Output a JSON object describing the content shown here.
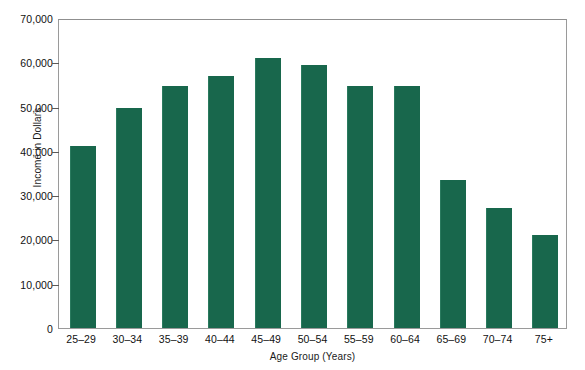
{
  "chart_data": {
    "type": "bar",
    "title": "",
    "xlabel": "Age Group (Years)",
    "ylabel": "Income in Dollars",
    "categories": [
      "25–29",
      "30–34",
      "35–39",
      "40–44",
      "45–49",
      "50–54",
      "55–59",
      "60–64",
      "65–69",
      "70–74",
      "75+"
    ],
    "values": [
      41000,
      49700,
      54600,
      57000,
      61000,
      59300,
      54700,
      54700,
      33500,
      27200,
      20900
    ],
    "ylim": [
      0,
      70000
    ],
    "ytick_values": [
      0,
      10000,
      20000,
      30000,
      40000,
      50000,
      60000,
      70000
    ],
    "ytick_labels": [
      "0",
      "10,000",
      "20,000",
      "30,000",
      "40,000",
      "50,000",
      "60,000",
      "70,000"
    ],
    "grid": false,
    "legend": null,
    "bar_color": "#18674C",
    "axis_color": "#9A9A9A",
    "background_color": "#FFFFFF"
  }
}
